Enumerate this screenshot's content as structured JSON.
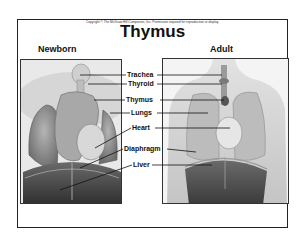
{
  "copyright": "Copyright © The McGraw-Hill Companies, Inc. Permission required for reproduction or display.",
  "title": "Thymus",
  "panels": {
    "left": {
      "label": "Newborn"
    },
    "right": {
      "label": "Adult"
    }
  },
  "labels": [
    "Trachea",
    "Thyroid",
    "Thymus",
    "Lungs",
    "Heart",
    "Diaphragm",
    "Liver"
  ],
  "colors": {
    "ink": "#111111",
    "frame": "#222222",
    "tissue_light": "#c9c9c9",
    "tissue_dark": "#4a4a4a"
  }
}
